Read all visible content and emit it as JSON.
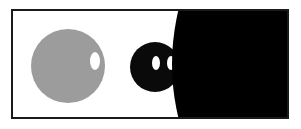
{
  "page": {
    "width": 301,
    "height": 129,
    "background_color": "#ffffff"
  },
  "frame": {
    "label": "Illustration frame",
    "x": 11,
    "y": 9,
    "width": 278,
    "height": 110,
    "stroke_color": "#1a1a1a",
    "stroke_width": 2,
    "fill_color": "#ffffff"
  },
  "shapes": {
    "gray_circle": {
      "label": "Gray circle",
      "cx": 68,
      "cy": 66,
      "r": 37,
      "fill_color": "#9c9c9c"
    },
    "gray_circle_highlight": {
      "label": "White oval highlight on gray circle",
      "cx": 95,
      "cy": 61,
      "rx": 5,
      "ry": 9,
      "fill_color": "#ffffff"
    },
    "black_blob": {
      "label": "Small black circle",
      "cx": 155,
      "cy": 67,
      "r": 25,
      "fill_color": "#0a0a0a"
    },
    "black_blob_eye_left": {
      "label": "Left white oval on small black circle",
      "cx": 156,
      "cy": 63,
      "rx": 4,
      "ry": 7,
      "fill_color": "#ffffff"
    },
    "black_blob_eye_right": {
      "label": "Right white oval on small black circle",
      "cx": 171,
      "cy": 63,
      "rx": 4,
      "ry": 7,
      "fill_color": "#ffffff"
    },
    "large_black_circle": {
      "label": "Large black circle entering from right",
      "cx": 402,
      "cy": 64,
      "r": 230,
      "fill_color": "#000000"
    }
  },
  "accessibility": {
    "description": "Abstract illustration: a gray circle with a white oval cutout, a small black circle with two white oval cutouts, and a large black circle occupying the right side, all inside a thin dark rectangular frame."
  }
}
